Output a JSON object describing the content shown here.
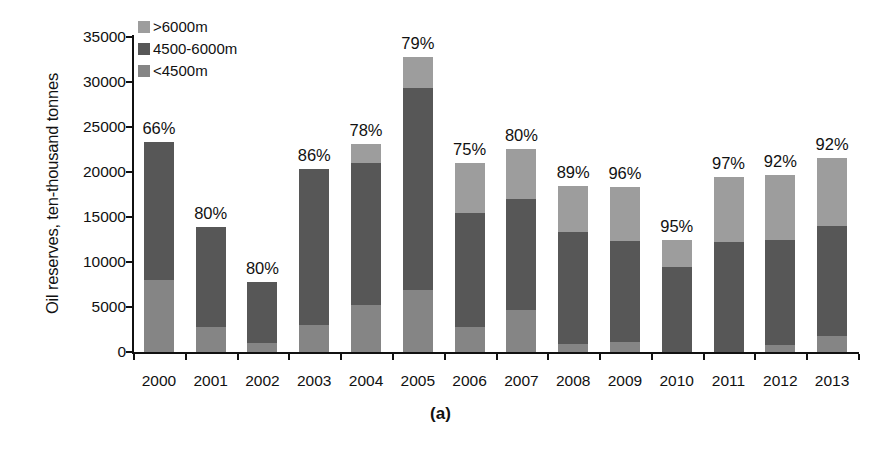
{
  "chart_data": {
    "type": "bar",
    "subtype": "stacked",
    "title": "",
    "caption": "(a)",
    "xlabel": "",
    "ylabel": "Oil reserves, ten-thousand tonnes",
    "ylim": [
      0,
      35000
    ],
    "yticks": [
      0,
      5000,
      10000,
      15000,
      20000,
      25000,
      30000,
      35000
    ],
    "ytick_labels": [
      "0",
      "5000",
      "10000",
      "15000",
      "20000",
      "25000",
      "30000",
      "35000"
    ],
    "grid": false,
    "legend_position": "top-left",
    "categories": [
      "2000",
      "2001",
      "2002",
      "2003",
      "2004",
      "2005",
      "2006",
      "2007",
      "2008",
      "2009",
      "2010",
      "2011",
      "2012",
      "2013"
    ],
    "series": [
      {
        "name": "<4500m",
        "color": "#858585",
        "values": [
          8000,
          2800,
          1000,
          3000,
          5200,
          6900,
          2800,
          4700,
          900,
          1100,
          0,
          0,
          800,
          1800
        ]
      },
      {
        "name": "4500-6000m",
        "color": "#575757",
        "values": [
          15300,
          11100,
          6800,
          17300,
          15800,
          22400,
          12700,
          12300,
          12400,
          11200,
          9500,
          12200,
          11700,
          12200
        ]
      },
      {
        "name": ">6000m",
        "color": "#9d9d9d",
        "values": [
          0,
          0,
          0,
          0,
          2100,
          3500,
          5500,
          5600,
          5200,
          6000,
          3000,
          7300,
          7200,
          7600
        ]
      }
    ],
    "totals": [
      23300,
      13900,
      7800,
      20300,
      23100,
      32800,
      21000,
      22600,
      18500,
      18300,
      12500,
      19500,
      19700,
      21600
    ],
    "bar_labels": [
      "66%",
      "80%",
      "80%",
      "86%",
      "78%",
      "79%",
      "75%",
      "80%",
      "89%",
      "96%",
      "95%",
      "97%",
      "92%",
      "92%"
    ]
  },
  "legend": {
    "items": [
      {
        "label": ">6000m",
        "color": "#9d9d9d"
      },
      {
        "label": "4500-6000m",
        "color": "#575757"
      },
      {
        "label": "<4500m",
        "color": "#858585"
      }
    ]
  }
}
